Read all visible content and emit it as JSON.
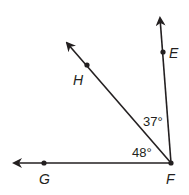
{
  "diagram": {
    "type": "geometry-angles",
    "vertex": {
      "label": "F",
      "x": 171,
      "y": 163
    },
    "rays": [
      {
        "name": "FE",
        "point_label": "E",
        "point": {
          "x": 163,
          "y": 52
        },
        "tip": {
          "x": 160,
          "y": 16
        }
      },
      {
        "name": "FH",
        "point_label": "H",
        "point": {
          "x": 87,
          "y": 65
        },
        "tip": {
          "x": 65,
          "y": 40
        }
      },
      {
        "name": "FG",
        "point_label": "G",
        "point": {
          "x": 44,
          "y": 163
        },
        "tip": {
          "x": 12,
          "y": 163
        }
      }
    ],
    "angles": [
      {
        "between": "EFH",
        "label": "37°"
      },
      {
        "between": "HFG",
        "label": "48°"
      }
    ],
    "colors": {
      "stroke": "#231f20",
      "background": "#ffffff"
    }
  },
  "labels": {
    "E": "E",
    "H": "H",
    "G": "G",
    "F": "F",
    "angle_efh": "37°",
    "angle_hfg": "48°"
  }
}
